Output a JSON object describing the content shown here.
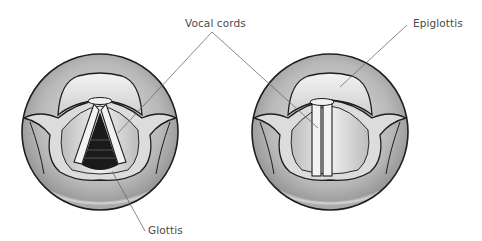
{
  "figure": {
    "panels": [
      {
        "id": "left",
        "state": "open glottis (breathing)"
      },
      {
        "id": "right",
        "state": "closed glottis (phonation)"
      }
    ],
    "labels": {
      "vocal_cords": "Vocal cords",
      "epiglottis": "Epiglottis",
      "glottis": "Glottis"
    },
    "colors": {
      "outline": "#1e1e1e",
      "tissue_light": "#ececec",
      "tissue_mid": "#bdbdbd",
      "tissue_dark": "#8c8c8c",
      "glottis_dark": "#1a1a1a",
      "leader": "#6a6a6a",
      "text": "#4a4a4a"
    }
  }
}
